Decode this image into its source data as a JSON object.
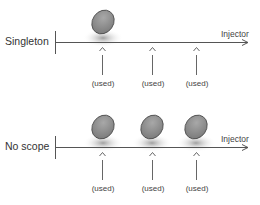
{
  "colors": {
    "line": "#555555",
    "ellipse_fill": "#8a8a8a",
    "ellipse_stroke": "#4a4a4a",
    "shadow": "#9a9a9a",
    "text": "#333333"
  },
  "rows": [
    {
      "label": "Singleton",
      "axis_label": "Injector",
      "instances": 1,
      "usages": [
        {
          "label": "(used)"
        },
        {
          "label": "(used)"
        },
        {
          "label": "(used)"
        }
      ]
    },
    {
      "label": "No scope",
      "axis_label": "Injector",
      "instances": 3,
      "usages": [
        {
          "label": "(used)"
        },
        {
          "label": "(used)"
        },
        {
          "label": "(used)"
        }
      ]
    }
  ]
}
